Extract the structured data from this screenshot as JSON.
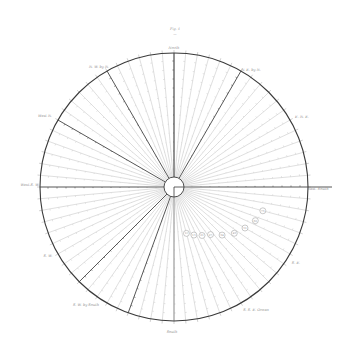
{
  "figure": {
    "title": "Fig. 4",
    "subtitle": "—",
    "background": "#ffffff",
    "ink_color": "#444444",
    "light_ink_color": "#b8b8b8",
    "circle": {
      "cx": 174,
      "cy": 187,
      "r": 134
    },
    "hub": {
      "r": 10
    },
    "radial_step_deg": 5,
    "heavy_angles_deg": [
      0,
      60,
      90,
      120,
      150,
      180,
      225,
      250
    ],
    "labels": [
      {
        "id": "top",
        "text": "North",
        "x": 174,
        "y": 49
      },
      {
        "id": "top_left",
        "text": "N. W. by N.",
        "x": 99,
        "y": 68
      },
      {
        "id": "top_right",
        "text": "N. E. by N.",
        "x": 251,
        "y": 71
      },
      {
        "id": "upper_left",
        "text": "West N.",
        "x": 45,
        "y": 117
      },
      {
        "id": "right_upper",
        "text": "E. N. E.",
        "x": 302,
        "y": 118
      },
      {
        "id": "left",
        "text": "West-S. W.",
        "x": 30,
        "y": 186
      },
      {
        "id": "right",
        "text": "East. South",
        "x": 318,
        "y": 190
      },
      {
        "id": "lower_left",
        "text": "S. W.",
        "x": 48,
        "y": 257
      },
      {
        "id": "bottom_left",
        "text": "S. W. by South",
        "x": 86,
        "y": 306
      },
      {
        "id": "bottom",
        "text": "South",
        "x": 172,
        "y": 333
      },
      {
        "id": "bottom_right",
        "text": "S. S. E. Ocean",
        "x": 256,
        "y": 311
      },
      {
        "id": "right_lower",
        "text": "S. E.",
        "x": 296,
        "y": 264
      }
    ],
    "markers": [
      {
        "angle_deg": -15,
        "dist": 92,
        "text": "73"
      },
      {
        "angle_deg": -22.5,
        "dist": 88,
        "text": "62"
      },
      {
        "angle_deg": -30,
        "dist": 82,
        "text": "51"
      },
      {
        "angle_deg": -37.5,
        "dist": 76,
        "text": "43"
      },
      {
        "angle_deg": -45,
        "dist": 68,
        "text": "34"
      },
      {
        "angle_deg": -52.5,
        "dist": 60,
        "text": "27"
      },
      {
        "angle_deg": -60,
        "dist": 56,
        "text": "21"
      },
      {
        "angle_deg": -67.5,
        "dist": 52,
        "text": "15"
      },
      {
        "angle_deg": -75,
        "dist": 48,
        "text": "10"
      }
    ]
  }
}
